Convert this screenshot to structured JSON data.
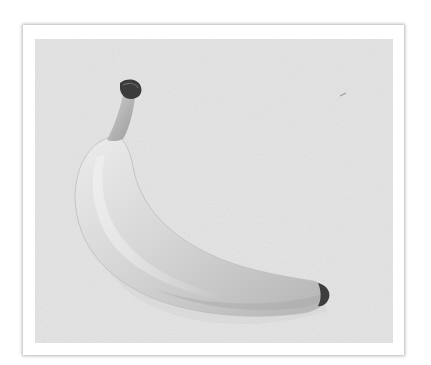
{
  "image": {
    "subject": "banana",
    "description": "Single ripe banana photographed on a light textured background, shown in grayscale inside a white frame with a soft grey drop shadow",
    "colors": {
      "page_background": "#ffffff",
      "frame_border": "#ffffff",
      "frame_shadow": "#8a8a8a",
      "photo_background": "#e6e6e6",
      "banana_light": "#e9e9e9",
      "banana_mid": "#c9c9c9",
      "banana_shadow": "#a8a8a8",
      "stem_tip": "#3a3a3a"
    }
  }
}
